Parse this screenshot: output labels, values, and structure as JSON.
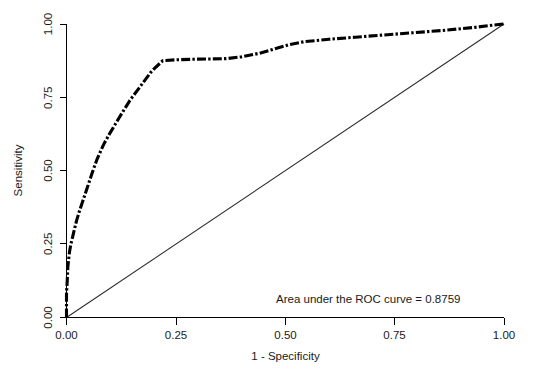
{
  "chart_data": {
    "type": "line",
    "title": "",
    "subtitle": "",
    "xlabel": "1 - Specificity",
    "ylabel": "Sensitivity",
    "xlim": [
      0,
      1
    ],
    "ylim": [
      0,
      1
    ],
    "grid": false,
    "legend": null,
    "xticks": [
      "0.00",
      "0.25",
      "0.50",
      "0.75",
      "1.00"
    ],
    "xtick_values": [
      0.0,
      0.25,
      0.5,
      0.75,
      1.0
    ],
    "yticks": [
      "0.00",
      "0.25",
      "0.50",
      "0.75",
      "1.00"
    ],
    "ytick_values": [
      0.0,
      0.25,
      0.5,
      0.75,
      1.0
    ],
    "annotations": [
      {
        "name": "auc-annotation",
        "text": "Area under the ROC curve = 0.8759",
        "x": 0.62,
        "y": 0.08
      }
    ],
    "series": [
      {
        "name": "ROC curve",
        "style": "dash-dot",
        "color": "#000000",
        "linewidth": 3.1,
        "x": [
          0.0,
          0.0,
          0.002,
          0.003,
          0.005,
          0.007,
          0.01,
          0.014,
          0.018,
          0.023,
          0.03,
          0.038,
          0.047,
          0.058,
          0.07,
          0.085,
          0.1,
          0.12,
          0.145,
          0.17,
          0.195,
          0.22,
          0.25,
          0.29,
          0.33,
          0.365,
          0.4,
          0.44,
          0.475,
          0.51,
          0.545,
          0.6,
          0.66,
          0.72,
          0.79,
          0.86,
          0.93,
          0.975,
          1.0
        ],
        "y": [
          0.0,
          0.08,
          0.135,
          0.17,
          0.2,
          0.225,
          0.25,
          0.275,
          0.3,
          0.33,
          0.365,
          0.4,
          0.44,
          0.49,
          0.54,
          0.59,
          0.63,
          0.68,
          0.74,
          0.79,
          0.84,
          0.875,
          0.878,
          0.88,
          0.881,
          0.882,
          0.888,
          0.9,
          0.915,
          0.93,
          0.94,
          0.948,
          0.955,
          0.962,
          0.97,
          0.978,
          0.988,
          0.996,
          1.0
        ]
      },
      {
        "name": "Reference diagonal",
        "style": "solid",
        "color": "#2b2b2b",
        "linewidth": 1.05,
        "x": [
          0.0,
          1.0
        ],
        "y": [
          0.0,
          1.0
        ]
      }
    ],
    "auc": 0.8759
  },
  "axes": {
    "x_title": "1 - Specificity",
    "y_title": "Sensitivity"
  },
  "labels": {
    "x": [
      "0.00",
      "0.25",
      "0.50",
      "0.75",
      "1.00"
    ],
    "y": [
      "0.00",
      "0.25",
      "0.50",
      "0.75",
      "1.00"
    ]
  },
  "annotation": {
    "auc_text": "Area under the ROC curve = 0.8759"
  },
  "colors": {
    "background": "#ffffff",
    "axis": "#000000",
    "curve": "#000000",
    "diagonal": "#2b2b2b",
    "text": "#1a1a1a"
  }
}
